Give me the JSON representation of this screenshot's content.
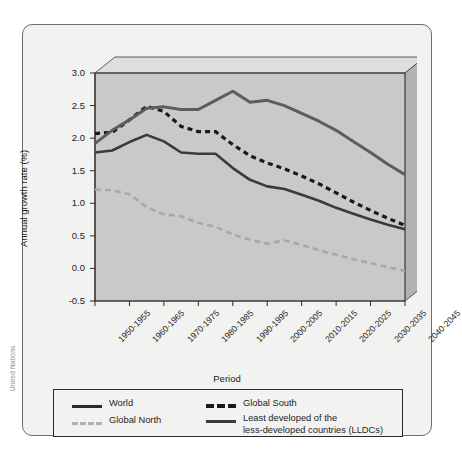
{
  "credit": "United Nations",
  "chart_data": {
    "type": "line",
    "title": "",
    "xlabel": "Period",
    "ylabel": "Annual growth rate (%)",
    "ylim": [
      -0.5,
      3.0
    ],
    "ytick_step": 0.5,
    "yticks": [
      "3.0",
      "2.5",
      "2.0",
      "1.5",
      "1.0",
      "0.5",
      "0.0",
      "-0.5"
    ],
    "ytick_values": [
      3.0,
      2.5,
      2.0,
      1.5,
      1.0,
      0.5,
      0.0,
      -0.5
    ],
    "grid": false,
    "legend_position": "bottom",
    "categories": [
      "1950-1955",
      "1955-1960",
      "1960-1965",
      "1965-1970",
      "1970-1975",
      "1975-1980",
      "1980-1985",
      "1985-1990",
      "1990-1995",
      "1995-2000",
      "2000-2005",
      "2005-2010",
      "2010-2015",
      "2015-2020",
      "2020-2025",
      "2025-2030",
      "2030-2035",
      "2035-2040",
      "2040-2045"
    ],
    "xtick_labels": [
      "1950-1955",
      "1960-1965",
      "1970-1975",
      "1980-1985",
      "1990-1995",
      "2000-2005",
      "2010-2015",
      "2020-2025",
      "2030-2035",
      "2040-2045"
    ],
    "series": [
      {
        "name": "World",
        "style": "solid",
        "color": "#3a3a3a",
        "values": [
          1.78,
          1.81,
          1.94,
          2.05,
          1.95,
          1.78,
          1.76,
          1.76,
          1.54,
          1.36,
          1.26,
          1.22,
          1.13,
          1.04,
          0.93,
          0.84,
          0.75,
          0.67,
          0.6
        ]
      },
      {
        "name": "Global South",
        "style": "dashed",
        "color": "#1a1a1a",
        "values": [
          2.07,
          2.09,
          2.28,
          2.49,
          2.41,
          2.18,
          2.1,
          2.1,
          1.9,
          1.73,
          1.62,
          1.53,
          1.42,
          1.3,
          1.16,
          1.02,
          0.89,
          0.77,
          0.66
        ]
      },
      {
        "name": "Global North",
        "style": "dashed-light",
        "color": "#a8a8a8",
        "values": [
          1.21,
          1.2,
          1.14,
          0.94,
          0.83,
          0.8,
          0.7,
          0.64,
          0.52,
          0.44,
          0.38,
          0.43,
          0.36,
          0.28,
          0.21,
          0.14,
          0.08,
          0.02,
          -0.04
        ]
      },
      {
        "name": "Least developed of the less-developed countries (LLDCs)",
        "style": "solid-thick",
        "color": "#5d5d5d",
        "values": [
          1.92,
          2.12,
          2.28,
          2.46,
          2.48,
          2.44,
          2.44,
          2.58,
          2.72,
          2.55,
          2.58,
          2.5,
          2.38,
          2.26,
          2.12,
          1.95,
          1.78,
          1.6,
          1.44
        ]
      }
    ]
  },
  "legend": {
    "items": [
      {
        "label": "World",
        "style": "solid",
        "color": "#2b2b2b"
      },
      {
        "label": "Global South",
        "style": "dashed",
        "color": "#1a1a1a"
      },
      {
        "label": "Global North",
        "style": "dashed-light",
        "color": "#b0b0b0"
      },
      {
        "label": "Least developed of the",
        "label2": "less-developed countries (LLDCs)",
        "style": "solid-thick",
        "color": "#3a3a3a"
      }
    ]
  },
  "colors": {
    "plot_bg": "#c9c9c7",
    "wall_top": "#dededc",
    "wall_side": "#b2b2b0",
    "card_bg": "#f2f2f0",
    "frame": "#4a4a4a"
  }
}
